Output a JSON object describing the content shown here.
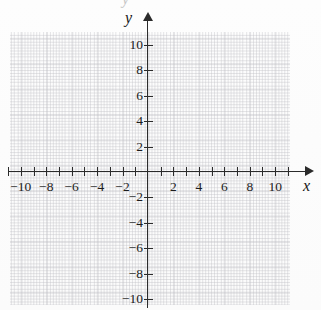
{
  "chart_data": {
    "type": "scatter",
    "title": "",
    "xlabel": "x",
    "ylabel": "y",
    "xlim": [
      -11,
      11.5
    ],
    "ylim": [
      -11.5,
      11.5
    ],
    "grid": true,
    "grid_spacing": 2,
    "legend": "none",
    "series": [],
    "x_tick_labels": [
      "-10",
      "-8",
      "-6",
      "-4",
      "-2",
      "2",
      "4",
      "6",
      "8",
      "10"
    ],
    "x_tick_values": [
      -10,
      -8,
      -6,
      -4,
      -2,
      2,
      4,
      6,
      8,
      10
    ],
    "x_minor_tick_values": [
      -11,
      -10,
      -9,
      -8,
      -7,
      -6,
      -5,
      -4,
      -3,
      -2,
      -1,
      1,
      2,
      3,
      4,
      5,
      6,
      7,
      8,
      9,
      10,
      11
    ],
    "y_tick_labels": [
      "10",
      "8",
      "6",
      "4",
      "2",
      "-2",
      "-4",
      "-6",
      "-8",
      "-10"
    ],
    "y_tick_values": [
      10,
      8,
      6,
      4,
      2,
      -2,
      -4,
      -6,
      -8,
      -10
    ],
    "origin_label": "",
    "axis_color": "#2b2b2b",
    "grid_color": "#8c8c9a",
    "background": "#fdfdfd"
  },
  "axes": {
    "x_name": "x",
    "y_name": "y"
  },
  "artifact": {
    "top_cutoff_glyph": "y"
  }
}
